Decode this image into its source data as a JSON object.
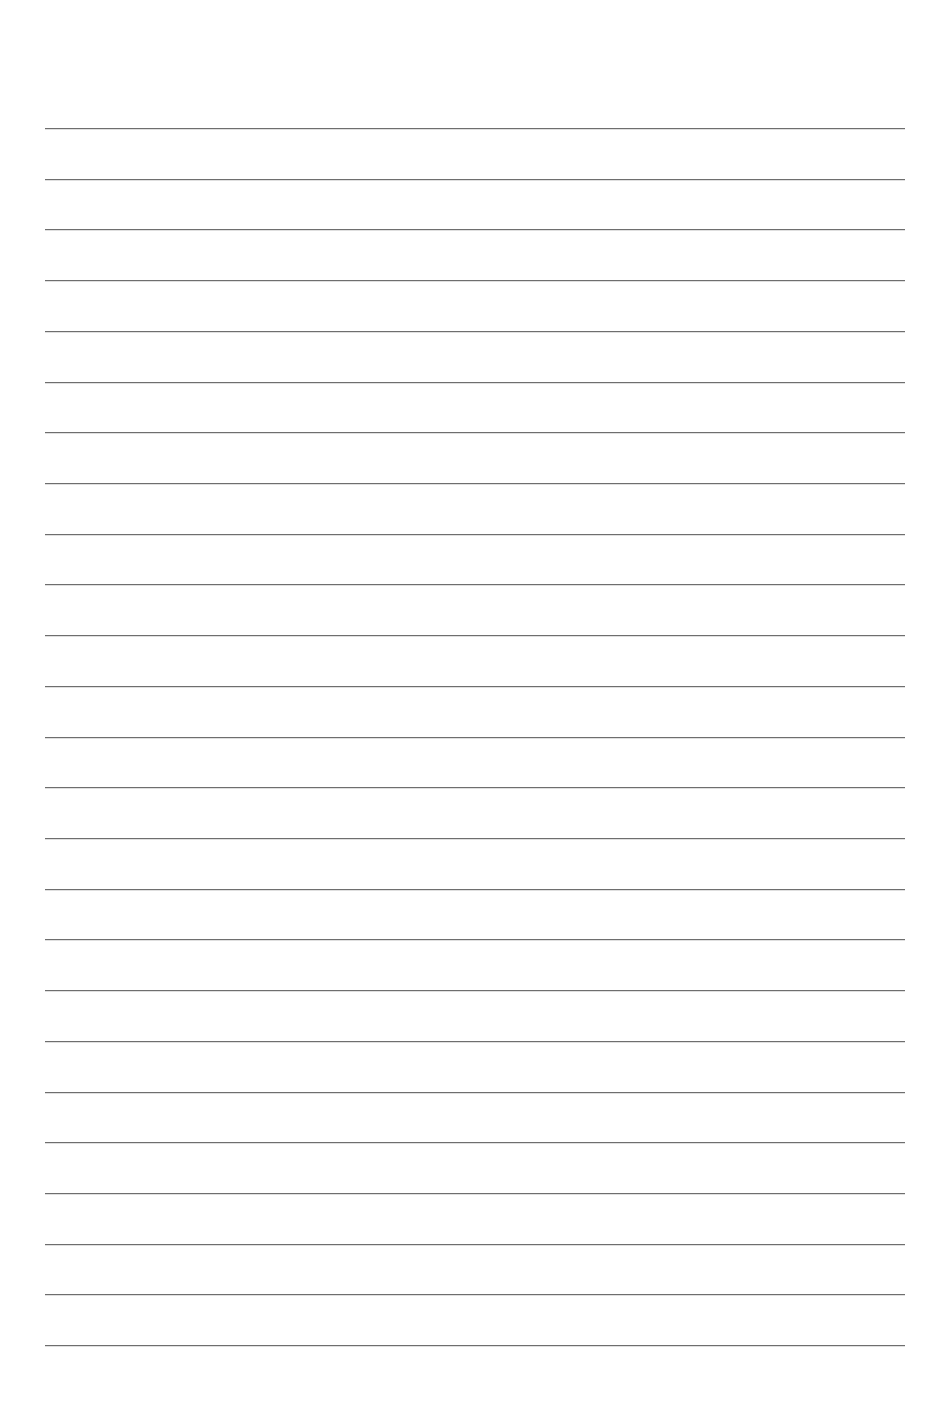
{
  "document": {
    "type": "ruled-paper",
    "title": "Blank Lined Paper",
    "content_text": "",
    "page_width": 928,
    "page_height": 1402,
    "background_color": "#ffffff"
  },
  "ruling": {
    "line_color": "#6e6e6e",
    "line_thickness_px": 1,
    "line_count": 25,
    "line_spacing_px": 50.7,
    "first_line_y": 128,
    "last_line_y": 1345,
    "line_start_x": 45,
    "line_end_x": 905,
    "line_length_px": 860,
    "line_ys": [
      128,
      179,
      229,
      280,
      331,
      382,
      432,
      483,
      534,
      584,
      635,
      686,
      737,
      787,
      838,
      889,
      939,
      990,
      1041,
      1092,
      1142,
      1193,
      1244,
      1294,
      1345
    ]
  },
  "margins": {
    "top_px": 128,
    "bottom_px": 57,
    "left_px": 45,
    "right_px": 23
  },
  "writing_area": {
    "label": "writing area",
    "value": ""
  }
}
